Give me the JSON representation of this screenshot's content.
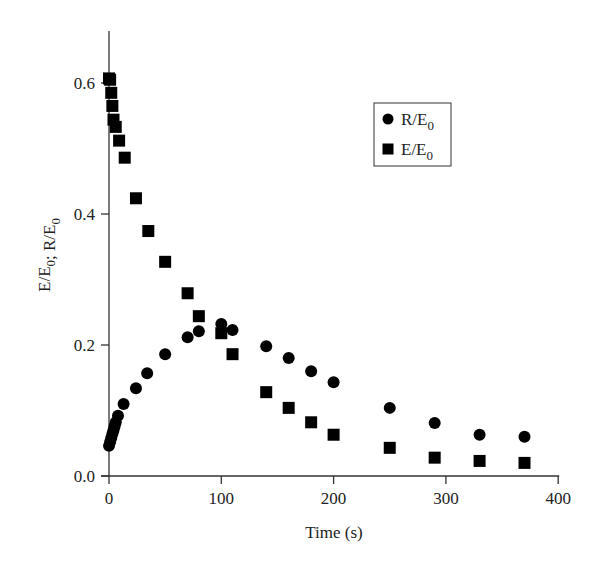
{
  "chart_data": {
    "type": "scatter",
    "title": "",
    "xlabel": "Time (s)",
    "ylabel": "E/E0; R/E0",
    "ylabel_parts": [
      {
        "text": "E/E",
        "sub": "0"
      },
      {
        "text": "; R/E",
        "sub": "0"
      }
    ],
    "xlim": [
      0,
      400
    ],
    "ylim": [
      0,
      0.68
    ],
    "xticks": [
      0,
      100,
      200,
      300,
      400
    ],
    "xtick_labels": [
      "0",
      "100",
      "200",
      "300",
      "400"
    ],
    "yticks": [
      0.0,
      0.2,
      0.4,
      0.6
    ],
    "ytick_labels": [
      "0.0",
      "0.2",
      "0.4",
      "0.6"
    ],
    "grid": false,
    "legend_position": "upper right (inside)",
    "series": [
      {
        "name": "R/E0",
        "label_main": "R/E",
        "label_sub": "0",
        "marker": "circle",
        "color": "#000000",
        "x": [
          0,
          1,
          2,
          3,
          4,
          5,
          6,
          8,
          13,
          24,
          34,
          50,
          70,
          80,
          100,
          110,
          140,
          160,
          180,
          200,
          250,
          290,
          330,
          370
        ],
        "y": [
          0.046,
          0.052,
          0.058,
          0.064,
          0.07,
          0.076,
          0.082,
          0.092,
          0.11,
          0.134,
          0.157,
          0.186,
          0.212,
          0.221,
          0.232,
          0.223,
          0.198,
          0.18,
          0.16,
          0.143,
          0.104,
          0.081,
          0.063,
          0.06
        ]
      },
      {
        "name": "E/E0",
        "label_main": "E/E",
        "label_sub": "0",
        "marker": "square",
        "color": "#000000",
        "x": [
          0,
          1,
          2,
          3,
          4,
          6,
          9,
          14,
          24,
          35,
          50,
          70,
          80,
          100,
          110,
          140,
          160,
          180,
          200,
          250,
          290,
          330,
          370
        ],
        "y": [
          0.607,
          0.605,
          0.585,
          0.565,
          0.544,
          0.533,
          0.512,
          0.486,
          0.424,
          0.374,
          0.327,
          0.279,
          0.244,
          0.218,
          0.186,
          0.128,
          0.104,
          0.082,
          0.063,
          0.043,
          0.028,
          0.023,
          0.02
        ]
      }
    ]
  }
}
